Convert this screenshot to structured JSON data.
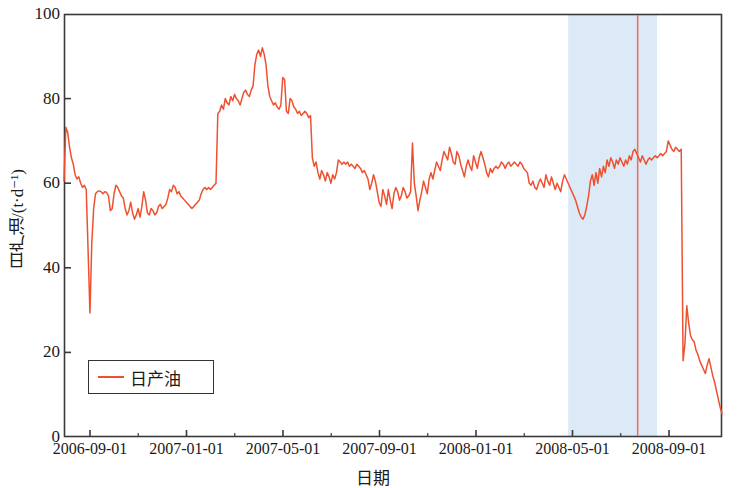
{
  "chart_data": {
    "type": "line",
    "title": "",
    "xlabel": "日期",
    "ylabel": "日产油/(t·d⁻¹)",
    "ylim": [
      0,
      100
    ],
    "ytick_values": [
      0,
      20,
      40,
      60,
      80,
      100
    ],
    "ytick_labels": [
      "0",
      "20",
      "40",
      "60",
      "80",
      "100"
    ],
    "xtick_labels": [
      "2006-09-01",
      "2007-01-01",
      "2007-05-01",
      "2007-09-01",
      "2008-01-01",
      "2008-05-01",
      "2008-09-01"
    ],
    "xlim": [
      "2006-08-10",
      "2008-09-20"
    ],
    "grid": false,
    "legend": {
      "position": "lower-left",
      "entries": [
        {
          "label": "日产油",
          "color": "#ef5130",
          "style": "line"
        }
      ]
    },
    "annotations": {
      "shaded_band": {
        "label": "",
        "color": "#dce9f7",
        "x_start": "2008-03-10",
        "x_end": "2008-06-05"
      },
      "vertical_line": {
        "label": "",
        "color": "#f26a52",
        "x": "2008-06-25"
      }
    },
    "series": [
      {
        "name": "日产油",
        "color": "#ef5130",
        "x_index": [
          0,
          1,
          2,
          3,
          4,
          5,
          6,
          7,
          8,
          9,
          10,
          11,
          12,
          13,
          14,
          15,
          16,
          17,
          18,
          19,
          20,
          21,
          22,
          23,
          24,
          25,
          26,
          27,
          28,
          29,
          30,
          31,
          32,
          33,
          34,
          35,
          36,
          37,
          38,
          39,
          40,
          41,
          42,
          43,
          44,
          45,
          46,
          47,
          48,
          49,
          50,
          51,
          52,
          53,
          54,
          55,
          56,
          57,
          58,
          59,
          60,
          61,
          62,
          63,
          64,
          65,
          66,
          67,
          68,
          69,
          70,
          71,
          72,
          73,
          74,
          75,
          76,
          77,
          78,
          79,
          80,
          81,
          82,
          83,
          84,
          85,
          86,
          87,
          88,
          89,
          90,
          91,
          92,
          93,
          94,
          95,
          96,
          97,
          98,
          99,
          100,
          101,
          102,
          103,
          104,
          105,
          106,
          107,
          108,
          109,
          110,
          111,
          112,
          113,
          114,
          115,
          116,
          117,
          118,
          119,
          120,
          121,
          122,
          123,
          124,
          125,
          126,
          127,
          128,
          129,
          130,
          131,
          132,
          133,
          134,
          135,
          136,
          137,
          138,
          139,
          140,
          141,
          142,
          143,
          144,
          145,
          146,
          147,
          148,
          149,
          150,
          151,
          152,
          153,
          154,
          155,
          156,
          157,
          158,
          159,
          160,
          161,
          162,
          163,
          164,
          165,
          166,
          167,
          168,
          169,
          170,
          171,
          172,
          173,
          174,
          175,
          176,
          177,
          178,
          179,
          180,
          181,
          182,
          183,
          184,
          185,
          186,
          187,
          188,
          189,
          190,
          191,
          192,
          193,
          194,
          195,
          196,
          197,
          198,
          199,
          200,
          201,
          202,
          203,
          204,
          205,
          206,
          207,
          208,
          209,
          210,
          211,
          212,
          213,
          214,
          215,
          216,
          217,
          218,
          219,
          220,
          221,
          222,
          223,
          224,
          225,
          226,
          227,
          228,
          229,
          230,
          231,
          232,
          233,
          234,
          235,
          236,
          237,
          238,
          239,
          240,
          241,
          242,
          243,
          244,
          245,
          246,
          247,
          248,
          249,
          250,
          251,
          252,
          253,
          254,
          255,
          256,
          257,
          258,
          259,
          260,
          261,
          262,
          263,
          264,
          265,
          266,
          267,
          268,
          269,
          270,
          271,
          272,
          273,
          274,
          275,
          276,
          277,
          278,
          279,
          280,
          281,
          282,
          283,
          284,
          285,
          286,
          287,
          288,
          289,
          290,
          291,
          292,
          293,
          294,
          295,
          296,
          297,
          298,
          299,
          300,
          301,
          302,
          303,
          304,
          305,
          306,
          307,
          308,
          309,
          310,
          311,
          312,
          313,
          314,
          315,
          316,
          317,
          318,
          319,
          320,
          321,
          322,
          323,
          324,
          325,
          326
        ],
        "values": [
          60.5,
          73.2,
          72.0,
          68.5,
          66.0,
          64.5,
          62.0,
          61.0,
          61.5,
          60.0,
          59.0,
          59.5,
          58.5,
          44.0,
          29.3,
          46.0,
          54.0,
          57.5,
          58.0,
          58.2,
          58.0,
          57.5,
          58.0,
          57.8,
          57.0,
          53.5,
          54.0,
          57.5,
          59.5,
          59.0,
          58.0,
          57.0,
          56.5,
          54.0,
          52.5,
          53.5,
          55.5,
          53.0,
          51.5,
          52.5,
          54.0,
          52.0,
          54.5,
          58.0,
          56.0,
          53.0,
          52.5,
          54.0,
          53.5,
          52.5,
          53.0,
          54.5,
          55.0,
          54.0,
          54.5,
          55.0,
          56.5,
          58.5,
          58.0,
          59.5,
          59.0,
          57.5,
          58.0,
          57.0,
          56.5,
          56.0,
          55.5,
          55.0,
          54.5,
          54.0,
          54.5,
          55.0,
          55.5,
          56.0,
          57.5,
          58.5,
          59.0,
          58.5,
          59.0,
          58.5,
          59.0,
          59.5,
          60.0,
          76.5,
          77.0,
          78.5,
          77.5,
          80.0,
          79.0,
          78.5,
          80.5,
          79.5,
          81.0,
          80.0,
          79.5,
          78.5,
          80.0,
          81.5,
          82.0,
          81.0,
          80.5,
          82.0,
          83.0,
          88.0,
          90.5,
          91.5,
          90.0,
          92.0,
          90.5,
          88.0,
          83.0,
          80.5,
          79.5,
          78.5,
          79.0,
          78.0,
          77.5,
          78.5,
          85.0,
          84.5,
          77.0,
          76.5,
          80.0,
          79.5,
          78.0,
          77.5,
          76.5,
          77.0,
          76.0,
          76.5,
          77.0,
          76.5,
          75.5,
          76.0,
          66.0,
          64.0,
          65.0,
          62.5,
          61.0,
          63.0,
          62.0,
          60.5,
          62.5,
          61.5,
          60.0,
          62.0,
          61.0,
          62.5,
          65.5,
          65.0,
          64.5,
          65.0,
          64.5,
          65.0,
          64.0,
          64.5,
          64.0,
          63.5,
          64.5,
          64.0,
          63.5,
          62.5,
          63.0,
          62.0,
          61.0,
          58.5,
          60.0,
          62.0,
          60.5,
          58.0,
          55.5,
          54.5,
          58.5,
          57.0,
          55.0,
          58.5,
          56.0,
          54.0,
          57.5,
          59.0,
          58.0,
          56.0,
          57.0,
          59.0,
          58.0,
          56.5,
          57.0,
          58.0,
          69.5,
          60.0,
          57.0,
          53.5,
          56.0,
          58.0,
          60.5,
          59.0,
          57.5,
          61.0,
          62.5,
          61.0,
          63.0,
          65.0,
          64.0,
          63.0,
          65.5,
          67.5,
          66.5,
          65.5,
          68.5,
          67.0,
          65.0,
          64.5,
          67.5,
          66.5,
          64.5,
          63.0,
          61.5,
          64.0,
          65.5,
          64.0,
          63.0,
          66.5,
          65.0,
          63.5,
          66.0,
          67.5,
          66.0,
          64.5,
          62.5,
          61.5,
          63.5,
          62.5,
          63.5,
          64.0,
          63.5,
          64.0,
          65.0,
          64.5,
          63.5,
          64.5,
          65.0,
          64.0,
          64.5,
          65.0,
          64.5,
          64.0,
          65.0,
          64.5,
          63.5,
          63.0,
          62.5,
          60.0,
          59.5,
          60.5,
          59.0,
          58.5,
          60.0,
          61.0,
          60.0,
          59.0,
          62.0,
          60.5,
          59.5,
          61.5,
          60.0,
          58.5,
          60.0,
          59.0,
          58.0,
          60.5,
          62.0,
          61.0,
          60.0,
          59.0,
          58.0,
          57.0,
          56.0,
          54.5,
          53.0,
          52.0,
          51.5,
          52.5,
          54.5,
          57.0,
          60.5,
          62.0,
          59.5,
          62.5,
          60.0,
          63.5,
          61.5,
          64.0,
          62.5,
          65.5,
          64.0,
          66.0,
          65.0,
          63.5,
          65.5,
          64.5,
          66.0,
          65.0,
          64.0,
          65.5,
          64.5,
          66.5,
          65.5,
          67.5,
          68.0,
          67.0,
          66.0,
          65.0,
          66.5,
          65.5,
          64.5,
          65.5,
          66.0,
          65.5,
          66.0,
          66.5,
          66.0,
          66.5,
          67.0,
          66.5,
          67.0,
          67.5,
          70.0,
          69.0,
          68.0,
          67.5,
          68.5,
          68.0,
          67.5,
          68.0,
          18.0,
          22.0,
          31.0,
          27.0,
          24.0,
          23.0,
          22.5,
          20.5,
          19.5,
          18.0,
          17.0,
          16.0,
          15.0,
          17.0,
          18.5,
          16.5,
          14.5,
          13.0,
          11.0,
          9.0,
          7.0,
          5.5
        ]
      }
    ]
  },
  "axes": {
    "plot_left_px": 64,
    "plot_top_px": 14,
    "plot_right_px": 722,
    "plot_bottom_px": 437
  }
}
